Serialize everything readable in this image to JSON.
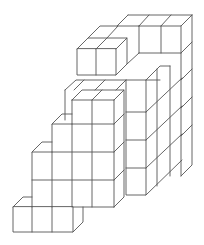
{
  "diagram": {
    "title": "",
    "stroke_color": "#555555",
    "background": "#ffffff"
  }
}
